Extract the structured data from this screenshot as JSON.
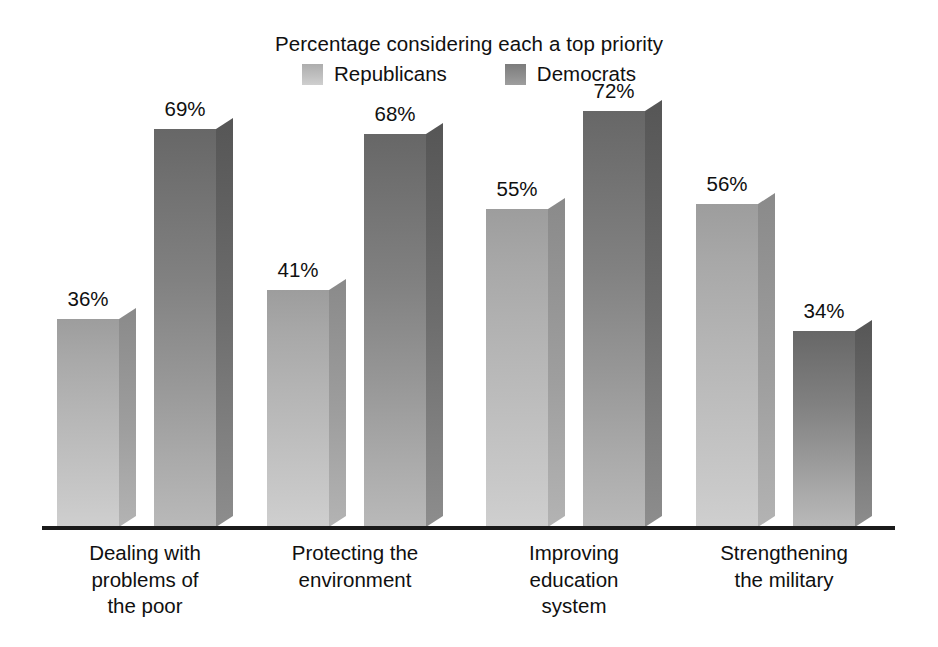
{
  "chart_data": {
    "type": "bar",
    "title": "Percentage considering each a top priority",
    "subtitle": "",
    "xlabel": "",
    "ylabel": "",
    "ylim": [
      0,
      80
    ],
    "grid": false,
    "legend_position": "top-center",
    "value_suffix": "%",
    "categories": [
      "Dealing with problems of the poor",
      "Protecting the environment",
      "Improving education system",
      "Strengthening the military"
    ],
    "category_lines": [
      [
        "Dealing with",
        "problems of",
        "the poor"
      ],
      [
        "Protecting the",
        "environment"
      ],
      [
        "Improving",
        "education",
        "system"
      ],
      [
        "Strengthening",
        "the military"
      ]
    ],
    "series": [
      {
        "name": "Republicans",
        "color": "#b4b4b4",
        "values": [
          36,
          41,
          55,
          56
        ],
        "labels": [
          "36%",
          "41%",
          "55%",
          "56%"
        ]
      },
      {
        "name": "Democrats",
        "color": "#818181",
        "values": [
          69,
          68,
          72,
          34
        ],
        "labels": [
          "69%",
          "68%",
          "72%",
          "34%"
        ]
      }
    ]
  },
  "legend": {
    "items": [
      {
        "label": "Republicans",
        "swatch": "republicans-swatch"
      },
      {
        "label": "Democrats",
        "swatch": "democrats-swatch"
      }
    ]
  },
  "axis": {
    "baseline_name": "category-axis-baseline"
  }
}
